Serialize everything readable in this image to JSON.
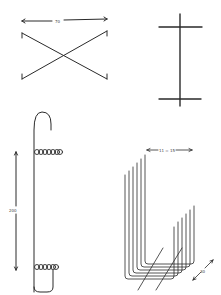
{
  "figure": {
    "background": "#ffffff",
    "ink_color": "#2a2a2a",
    "parts": [
      {
        "id": "x-crossed-wires",
        "dimension_label": "70"
      },
      {
        "id": "double-crossbar-post",
        "dimension_label": ""
      },
      {
        "id": "hooked-spring-wire",
        "dimension_label": "200"
      },
      {
        "id": "nested-u-wires",
        "dimension_label": "11 = 15",
        "depth_label": "30"
      }
    ]
  }
}
